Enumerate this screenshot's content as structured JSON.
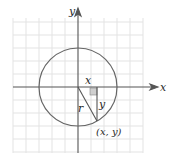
{
  "diagram": {
    "type": "unit-circle-point",
    "axes": {
      "x_label": "x",
      "y_label": "y"
    },
    "labels": {
      "horizontal_leg": "x",
      "vertical_leg": "y",
      "radius": "r",
      "point": "(x, y)"
    },
    "colors": {
      "grid": "#e3e3e3",
      "axes": "#555555",
      "circle": "#666666",
      "right_angle_fill": "#cfcfcf"
    }
  }
}
